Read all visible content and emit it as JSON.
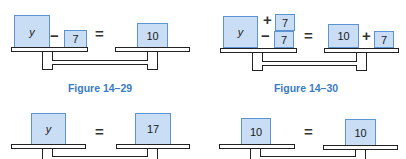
{
  "colors": {
    "box_fill": "#c9def5",
    "box_border": "#5b93d3",
    "caption": "#3a7cc4",
    "outline": "#222222"
  },
  "figures": [
    {
      "caption": "Figure 14–29",
      "left": {
        "terms": [
          "y",
          "−",
          "7"
        ]
      },
      "equals": "=",
      "right": {
        "terms": [
          "10"
        ]
      }
    },
    {
      "caption": "Figure 14–30",
      "left": {
        "terms": [
          "y",
          "+",
          "7",
          "−",
          "7"
        ]
      },
      "equals": "=",
      "right": {
        "terms": [
          "10",
          "+",
          "7"
        ]
      }
    },
    {
      "caption": "",
      "left": {
        "terms": [
          "y"
        ]
      },
      "equals": "=",
      "right": {
        "terms": [
          "17"
        ]
      }
    },
    {
      "caption": "",
      "left": {
        "terms": [
          "10"
        ]
      },
      "equals": "=",
      "right": {
        "terms": [
          "10"
        ]
      }
    }
  ]
}
